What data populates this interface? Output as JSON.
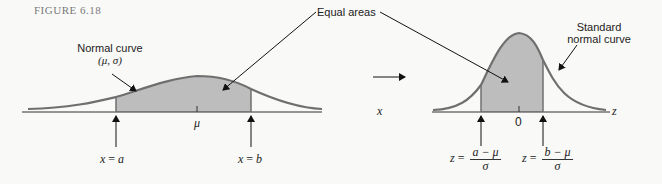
{
  "figure": {
    "caption": "FIGURE 6.18",
    "annotations": {
      "normal_curve": {
        "line1": "Normal curve",
        "line2": "(μ, σ)"
      },
      "equal_areas": "Equal areas",
      "standard_normal": {
        "line1": "Standard",
        "line2": "normal curve"
      }
    },
    "left_plot": {
      "axis_label": "x",
      "center_label": "μ",
      "lower_bound": {
        "var": "x",
        "eq": "=",
        "val": "a"
      },
      "upper_bound": {
        "var": "x",
        "eq": "=",
        "val": "b"
      }
    },
    "right_plot": {
      "axis_label": "z",
      "center_label": "0",
      "lower_bound": {
        "var": "z",
        "eq": "=",
        "num": "a − μ",
        "den": "σ"
      },
      "upper_bound": {
        "var": "z",
        "eq": "=",
        "num": "b − μ",
        "den": "σ"
      }
    },
    "colors": {
      "curve": "#6f6f6f",
      "shading": "#bdbdbd",
      "axis": "#333333",
      "background": "#f9f9f7"
    }
  }
}
